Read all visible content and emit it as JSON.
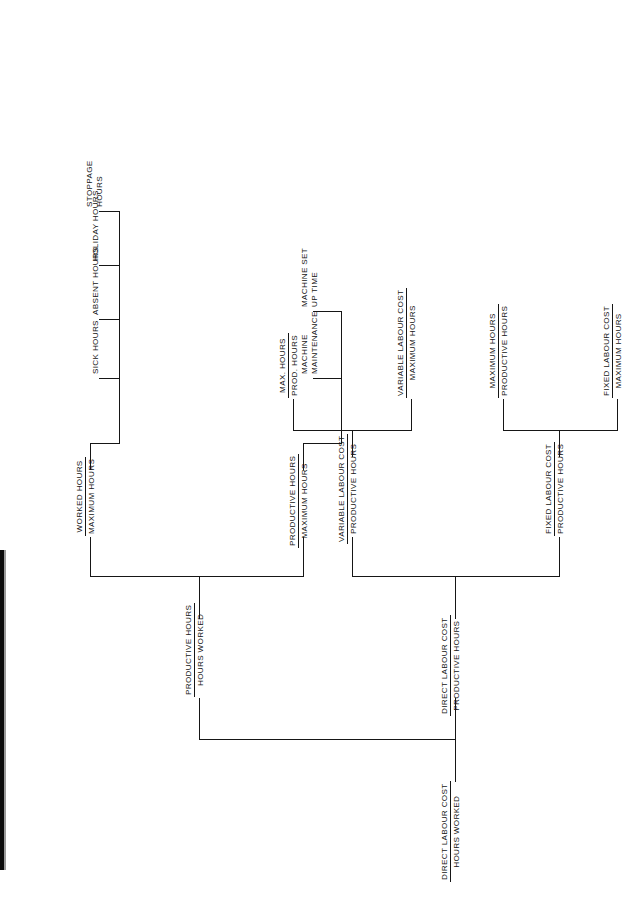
{
  "document": {
    "type": "hierarchical-ratio-tree",
    "orientation": "rotated-90-ccw",
    "page_background": "#ffffff",
    "line_color": "#161616",
    "text_color": "#141414"
  },
  "tree": {
    "root": {
      "id": "direct-labour-cost-hours-worked",
      "numerator": "DIRECT LABOUR COST",
      "denominator": "HOURS WORKED"
    },
    "level2": [
      {
        "id": "productive-hours-hours-worked",
        "numerator": "PRODUCTIVE HOURS",
        "denominator": "HOURS  WORKED"
      },
      {
        "id": "direct-labour-cost-productive-hours",
        "numerator": "DIRECT LABOUR COST",
        "denominator": "PRODUCTIVE HOURS"
      }
    ],
    "level3": [
      {
        "id": "worked-hours-maximum-hours",
        "numerator": "WORKED HOURS",
        "denominator": "MAXIMUM HOURS"
      },
      {
        "id": "productive-hours-maximum-hours",
        "numerator": "PRODUCTIVE HOURS",
        "denominator": "MAXIMUM HOURS"
      },
      {
        "id": "variable-labour-cost-productive-hours",
        "numerator": "VARIABLE LABOUR COST",
        "denominator": "PRODUCTIVE HOURS"
      },
      {
        "id": "fixed-labour-cost-productive-hours",
        "numerator": "FIXED LABOUR COST",
        "denominator": "PRODUCTIVE HOURS"
      }
    ],
    "level4_ratios": [
      {
        "id": "max-hours-prod-hours",
        "numerator": "MAX. HOURS",
        "denominator": "PROD. HOURS"
      },
      {
        "id": "variable-labour-cost-maximum-hours",
        "numerator": "VARIABLE LABOUR COST",
        "denominator": "MAXIMUM HOURS"
      },
      {
        "id": "maximum-hours-productive-hours",
        "numerator": "MAXIMUM HOURS",
        "denominator": "PRODUCTIVE HOURS"
      },
      {
        "id": "fixed-labour-cost-maximum-hours",
        "numerator": "FIXED LABOUR COST",
        "denominator": "MAXIMUM HOURS"
      }
    ],
    "leaves_worked_hours": [
      {
        "id": "sick-hours",
        "line1": "SICK HOURS",
        "line2": ""
      },
      {
        "id": "absent-hours",
        "line1": "ABSENT HOURS",
        "line2": ""
      },
      {
        "id": "holiday-hours",
        "line1": "HOLIDAY HOURS",
        "line2": ""
      },
      {
        "id": "stoppage-hours",
        "line1": "STOPPAGE",
        "line2": "HOURS"
      }
    ],
    "leaves_productive_hours": [
      {
        "id": "machine-maintenance",
        "line1": "MACHINE",
        "line2": "MAINTENANCE"
      },
      {
        "id": "machine-set-up-time",
        "line1": "MACHINE SET",
        "line2": "UP TIME"
      }
    ]
  }
}
